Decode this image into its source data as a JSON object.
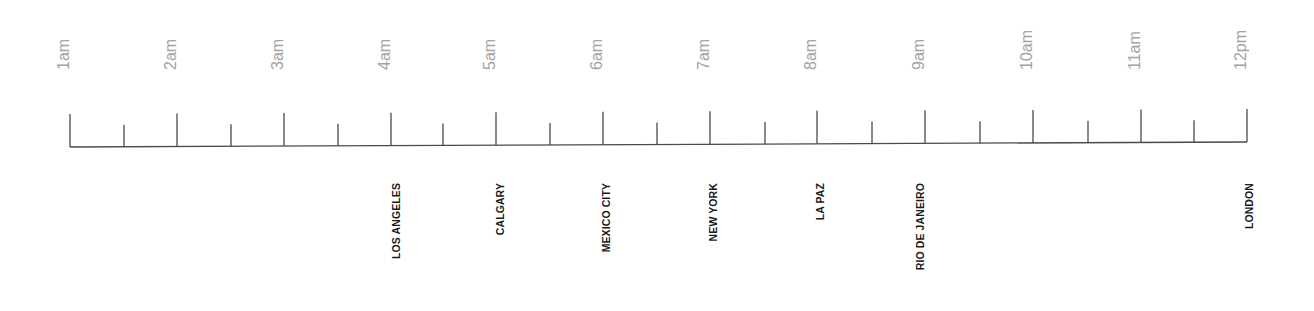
{
  "timeline": {
    "axis": {
      "x_start": 70,
      "x_end": 1247,
      "baseline_y_left": 147,
      "baseline_y_right": 142,
      "major_tick_height": 33,
      "minor_tick_height": 22,
      "line_color": "#4a4a4a"
    },
    "hours": [
      {
        "label": "1am",
        "x": 70
      },
      {
        "label": "2am",
        "x": 177
      },
      {
        "label": "3am",
        "x": 284
      },
      {
        "label": "4am",
        "x": 391
      },
      {
        "label": "5am",
        "x": 496
      },
      {
        "label": "6am",
        "x": 603
      },
      {
        "label": "7am",
        "x": 710
      },
      {
        "label": "8am",
        "x": 817
      },
      {
        "label": "9am",
        "x": 925
      },
      {
        "label": "10am",
        "x": 1033
      },
      {
        "label": "11am",
        "x": 1141
      },
      {
        "label": "12pm",
        "x": 1247
      }
    ],
    "half_hours_x": [
      124,
      231,
      338,
      443,
      550,
      657,
      765,
      872,
      980,
      1088,
      1194
    ],
    "time_label_color": "#a3a3a3",
    "cities": [
      {
        "label": "LOS ANGELES",
        "hour": "4am",
        "x": 396
      },
      {
        "label": "CALGARY",
        "hour": "5am",
        "x": 500
      },
      {
        "label": "MEXICO CITY",
        "hour": "6am",
        "x": 606
      },
      {
        "label": "NEW YORK",
        "hour": "7am",
        "x": 713
      },
      {
        "label": "LA PAZ",
        "hour": "8am",
        "x": 820
      },
      {
        "label": "RIO DE JANEIRO",
        "hour": "9am",
        "x": 920
      },
      {
        "label": "LONDON",
        "hour": "12pm",
        "x": 1249
      }
    ],
    "city_label_color": "#1a1a1a"
  }
}
